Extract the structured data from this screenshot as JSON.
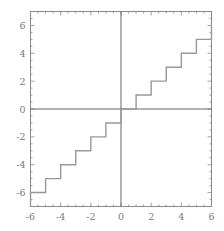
{
  "chart_data": {
    "type": "line",
    "title": "",
    "subtitle": "",
    "xlabel": "",
    "ylabel": "",
    "plot_style": "step",
    "function": "y = floor(x)",
    "xlim": [
      -6,
      6
    ],
    "ylim": [
      -7,
      7
    ],
    "grid": false,
    "legend": null,
    "axis_lines": {
      "x_axis_at_y": 0,
      "y_axis_at_x": 0,
      "color": "#666666"
    },
    "frame": {
      "visible": true,
      "color": "#8a8a8a"
    },
    "ticks": {
      "major_step": 2,
      "minor_step": 0.5,
      "direction": "in",
      "sides": [
        "bottom",
        "left",
        "top",
        "right"
      ]
    },
    "xticks": [
      -6,
      -4,
      -2,
      0,
      2,
      4,
      6
    ],
    "xtick_labels": [
      "-6",
      "-4",
      "-2",
      "0",
      "2",
      "4",
      "6"
    ],
    "yticks": [
      -6,
      -4,
      -2,
      0,
      2,
      4,
      6
    ],
    "ytick_labels": [
      "-6",
      "-4",
      "-2",
      "0",
      "2",
      "4",
      "6"
    ],
    "series": [
      {
        "name": "floor(x)",
        "color": "#999999",
        "linewidth": 1.4,
        "step_type": "post",
        "steps": [
          {
            "x_start": -6,
            "x_end": -5,
            "y": -6
          },
          {
            "x_start": -5,
            "x_end": -4,
            "y": -5
          },
          {
            "x_start": -4,
            "x_end": -3,
            "y": -4
          },
          {
            "x_start": -3,
            "x_end": -2,
            "y": -3
          },
          {
            "x_start": -2,
            "x_end": -1,
            "y": -2
          },
          {
            "x_start": -1,
            "x_end": 0,
            "y": -1
          },
          {
            "x_start": 0,
            "x_end": 1,
            "y": 0
          },
          {
            "x_start": 1,
            "x_end": 2,
            "y": 1
          },
          {
            "x_start": 2,
            "x_end": 3,
            "y": 2
          },
          {
            "x_start": 3,
            "x_end": 4,
            "y": 3
          },
          {
            "x_start": 4,
            "x_end": 5,
            "y": 4
          },
          {
            "x_start": 5,
            "x_end": 6,
            "y": 5
          },
          {
            "x_start": 6,
            "x_end": 6,
            "y": 6
          }
        ],
        "x": [
          -6,
          -5,
          -4,
          -3,
          -2,
          -1,
          0,
          1,
          2,
          3,
          4,
          5,
          6
        ],
        "values": [
          -6,
          -5,
          -4,
          -3,
          -2,
          -1,
          0,
          1,
          2,
          3,
          4,
          5,
          6
        ]
      }
    ]
  },
  "colors": {
    "background": "#ffffff",
    "step_line": "#999999",
    "axis_line": "#666666",
    "frame": "#8a8a8a",
    "tick_label": "#7a7a7a",
    "tick_mark": "#8a8a8a"
  }
}
